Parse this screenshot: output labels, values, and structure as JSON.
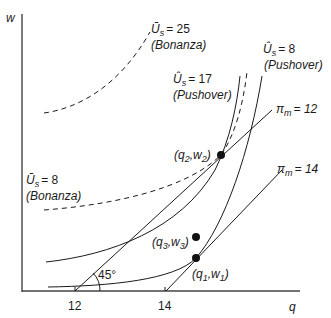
{
  "axes": {
    "y_label": "w",
    "x_label": "q",
    "x_ticks": [
      "12",
      "14"
    ],
    "angle_label": "45°"
  },
  "curves": {
    "bonanza_25": {
      "symbol": "Ū",
      "sub": "s",
      "value": "= 25",
      "type": "(Bonanza)"
    },
    "bonanza_8": {
      "symbol": "Ū",
      "sub": "s",
      "value": "= 8",
      "type": "(Bonanza)"
    },
    "pushover_17": {
      "symbol": "Û",
      "sub": "s",
      "value": "= 17",
      "type": "(Pushover)"
    },
    "pushover_8": {
      "symbol": "Û",
      "sub": "s",
      "value": "= 8",
      "type": "(Pushover)"
    },
    "profit_12": {
      "symbol": "π",
      "sub": "m",
      "value": "= 12"
    },
    "profit_14": {
      "symbol": "π",
      "sub": "m",
      "value": "= 14"
    }
  },
  "points": {
    "p2": {
      "open": "(q",
      "s1": "2",
      "mid": ",w",
      "s2": "2",
      "close": ")"
    },
    "p3": {
      "open": "(q",
      "s1": "3",
      "mid": ",w",
      "s2": "3",
      "close": ")"
    },
    "p1": {
      "open": "(q",
      "s1": "1",
      "mid": ",w",
      "s2": "1",
      "close": ")"
    }
  }
}
